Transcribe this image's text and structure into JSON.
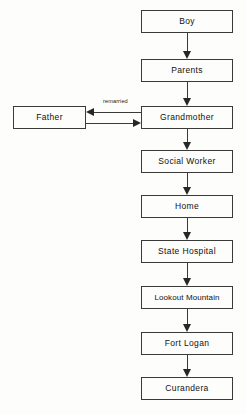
{
  "diagram": {
    "background_color": "#fdfdfc",
    "line_color": "#3a3a38",
    "text_color": "#111110",
    "nodes": [
      {
        "id": "boy",
        "label": "Boy",
        "x": 141,
        "y": 10,
        "w": 92,
        "h": 23
      },
      {
        "id": "parents",
        "label": "Parents",
        "x": 141,
        "y": 59,
        "w": 92,
        "h": 23
      },
      {
        "id": "father",
        "label": "Father",
        "x": 13,
        "y": 106,
        "w": 73,
        "h": 23
      },
      {
        "id": "grandmother",
        "label": "Grandmother",
        "x": 141,
        "y": 106,
        "w": 92,
        "h": 23
      },
      {
        "id": "social-worker",
        "label": "Social Worker",
        "x": 141,
        "y": 150,
        "w": 92,
        "h": 23
      },
      {
        "id": "home",
        "label": "Home",
        "x": 141,
        "y": 195,
        "w": 92,
        "h": 23
      },
      {
        "id": "state-hospital",
        "label": "State Hospital",
        "x": 141,
        "y": 240,
        "w": 92,
        "h": 23
      },
      {
        "id": "lookout-mountain",
        "label": "Lookout Mountain",
        "x": 141,
        "y": 286,
        "w": 92,
        "h": 23
      },
      {
        "id": "fort-logan",
        "label": "Fort Logan",
        "x": 141,
        "y": 332,
        "w": 92,
        "h": 23
      },
      {
        "id": "curandera",
        "label": "Curandera",
        "x": 141,
        "y": 377,
        "w": 92,
        "h": 23
      }
    ],
    "edges": [
      {
        "id": "boy-to-parents",
        "from": "boy",
        "to": "parents",
        "direction": "down",
        "label": ""
      },
      {
        "id": "parents-to-grandmother",
        "from": "parents",
        "to": "grandmother",
        "direction": "down",
        "label": ""
      },
      {
        "id": "grandmother-to-father",
        "from": "grandmother",
        "to": "father",
        "direction": "left",
        "label": "remarried"
      },
      {
        "id": "father-to-grandmother",
        "from": "father",
        "to": "grandmother",
        "direction": "right",
        "label": ""
      },
      {
        "id": "grandmother-to-social-worker",
        "from": "grandmother",
        "to": "social-worker",
        "direction": "down",
        "label": ""
      },
      {
        "id": "social-worker-to-home",
        "from": "social-worker",
        "to": "home",
        "direction": "down",
        "label": ""
      },
      {
        "id": "home-to-state-hospital",
        "from": "home",
        "to": "state-hospital",
        "direction": "down",
        "label": ""
      },
      {
        "id": "state-hospital-to-lookout-mountain",
        "from": "state-hospital",
        "to": "lookout-mountain",
        "direction": "down",
        "label": ""
      },
      {
        "id": "lookout-mountain-to-fort-logan",
        "from": "lookout-mountain",
        "to": "fort-logan",
        "direction": "down",
        "label": ""
      },
      {
        "id": "fort-logan-to-curandera",
        "from": "fort-logan",
        "to": "curandera",
        "direction": "down",
        "label": ""
      }
    ],
    "labels": {
      "remarried": "remarried"
    }
  }
}
